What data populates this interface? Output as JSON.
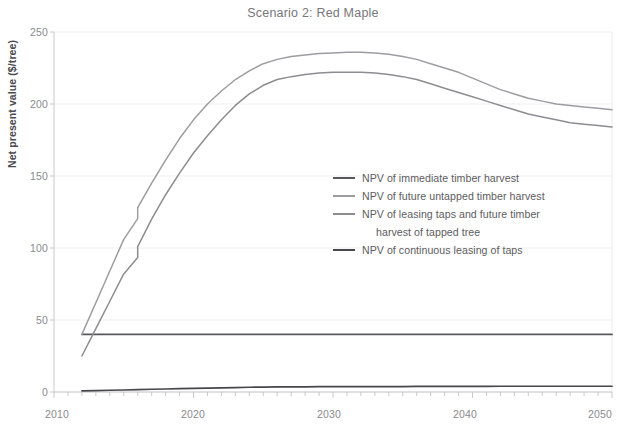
{
  "chart_data": {
    "type": "line",
    "title": "Scenario 2: Red Maple",
    "xlabel": "",
    "ylabel": "Net present value ($/tree)",
    "xlim": [
      2010,
      2050
    ],
    "ylim": [
      0,
      250
    ],
    "xticks": [
      2010,
      2020,
      2030,
      2040,
      2050
    ],
    "yticks": [
      0,
      50,
      100,
      150,
      200,
      250
    ],
    "minor_xtick_interval": 1,
    "grid": "horizontal-faint",
    "legend_position": "center-right-inside",
    "x": [
      2012,
      2013,
      2014,
      2015,
      2016,
      2017,
      2018,
      2019,
      2020,
      2021,
      2022,
      2023,
      2024,
      2025,
      2026,
      2027,
      2028,
      2029,
      2030,
      2031,
      2032,
      2033,
      2034,
      2035,
      2036,
      2037,
      2038,
      2039,
      2040,
      2041,
      2042,
      2043,
      2044,
      2045,
      2046,
      2047,
      2048,
      2049,
      2050
    ],
    "series": [
      {
        "name": "NPV of immediate timber harvest",
        "color": "#58575b",
        "width": 1.7,
        "values": [
          40,
          40,
          40,
          40,
          40,
          40,
          40,
          40,
          40,
          40,
          40,
          40,
          40,
          40,
          40,
          40,
          40,
          40,
          40,
          40,
          40,
          40,
          40,
          40,
          40,
          40,
          40,
          40,
          40,
          40,
          40,
          40,
          40,
          40,
          40,
          40,
          40,
          40,
          40
        ]
      },
      {
        "name": "NPV of future untapped timber harvest",
        "color": "#9d9ca1",
        "width": 1.5,
        "values": [
          40,
          62,
          84,
          106,
          128,
          145,
          161,
          176,
          189,
          200,
          209,
          217,
          223,
          228,
          231,
          233,
          234,
          235,
          235.5,
          236,
          236,
          235.5,
          234.5,
          233,
          231,
          228,
          225,
          222,
          218,
          214,
          210,
          207,
          204,
          202,
          200,
          199,
          198,
          197,
          196
        ]
      },
      {
        "name": "NPV of leasing taps and future timber harvest of tapped tree",
        "color": "#8d8c91",
        "width": 1.5,
        "values": [
          25,
          44,
          63,
          82,
          101,
          120,
          137,
          152,
          166,
          178,
          189,
          199,
          207,
          213,
          217,
          219,
          220.5,
          221.5,
          222,
          222,
          222,
          221.5,
          220.5,
          219,
          217,
          214,
          211,
          208,
          205,
          202,
          199,
          196,
          193,
          191,
          189,
          187,
          186,
          185,
          184
        ]
      },
      {
        "name": "NPV of continuous leasing of taps",
        "color": "#47464a",
        "width": 1.7,
        "values": [
          0.8,
          1.0,
          1.2,
          1.4,
          1.7,
          1.9,
          2.1,
          2.3,
          2.5,
          2.7,
          2.9,
          3.1,
          3.3,
          3.4,
          3.5,
          3.6,
          3.6,
          3.7,
          3.7,
          3.7,
          3.8,
          3.8,
          3.8,
          3.8,
          3.9,
          3.9,
          3.9,
          3.9,
          3.9,
          3.9,
          4.0,
          4.0,
          4.0,
          4.0,
          4.0,
          4.0,
          4.0,
          4.0,
          4.0
        ]
      }
    ],
    "annotations": [
      {
        "note": "Both rising curves show a small vertical step discontinuity at x=2016"
      }
    ]
  },
  "legend": {
    "items": [
      {
        "label": "NPV of immediate timber harvest",
        "color": "#58575b",
        "continuation": null
      },
      {
        "label": "NPV of future untapped timber harvest",
        "color": "#9d9ca1",
        "continuation": null
      },
      {
        "label": "NPV of leasing taps and future timber",
        "color": "#8d8c91",
        "continuation": "harvest of tapped tree"
      },
      {
        "label": "NPV of continuous leasing of taps",
        "color": "#47464a",
        "continuation": null
      }
    ]
  },
  "axes": {
    "y_tick_labels": [
      "250",
      "200",
      "150",
      "100",
      "50",
      "0"
    ],
    "x_tick_labels": [
      "2010",
      "2020",
      "2030",
      "2040",
      "2050"
    ],
    "y_axis_title": "Net present value ($/tree)"
  },
  "colors": {
    "title": "#77767b",
    "tick": "#8a898e",
    "axis_line": "#c9c8cc",
    "grid": "#f0eff1",
    "frame": "#eceaee"
  }
}
